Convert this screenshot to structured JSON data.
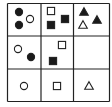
{
  "puzzle": {
    "type": "3x3 figure-reasoning grid",
    "colors": {
      "line": "#222222",
      "fill": "#1a1a1a",
      "background": "#ffffff"
    },
    "cells": [
      {
        "row": 0,
        "col": 0,
        "shapes": [
          {
            "kind": "circle",
            "filled": true
          },
          {
            "kind": "circle",
            "filled": true
          },
          {
            "kind": "circle",
            "filled": false
          }
        ]
      },
      {
        "row": 0,
        "col": 1,
        "shapes": [
          {
            "kind": "square",
            "filled": false
          },
          {
            "kind": "square",
            "filled": true
          },
          {
            "kind": "square",
            "filled": true
          }
        ]
      },
      {
        "row": 0,
        "col": 2,
        "shapes": [
          {
            "kind": "triangle",
            "filled": true
          },
          {
            "kind": "triangle",
            "filled": true
          },
          {
            "kind": "triangle",
            "filled": false
          }
        ]
      },
      {
        "row": 1,
        "col": 0,
        "shapes": [
          {
            "kind": "circle",
            "filled": false
          },
          {
            "kind": "circle",
            "filled": true
          }
        ]
      },
      {
        "row": 1,
        "col": 1,
        "shapes": [
          {
            "kind": "square",
            "filled": false
          },
          {
            "kind": "square",
            "filled": true
          }
        ]
      },
      {
        "row": 1,
        "col": 2,
        "shapes": []
      },
      {
        "row": 2,
        "col": 0,
        "shapes": [
          {
            "kind": "circle",
            "filled": false
          }
        ]
      },
      {
        "row": 2,
        "col": 1,
        "shapes": [
          {
            "kind": "square",
            "filled": false
          }
        ]
      },
      {
        "row": 2,
        "col": 2,
        "shapes": [
          {
            "kind": "triangle",
            "filled": false
          }
        ]
      }
    ]
  }
}
